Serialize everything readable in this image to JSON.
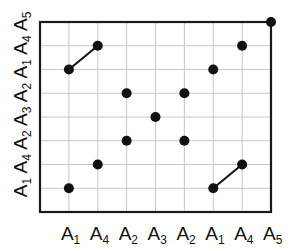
{
  "diagram": {
    "type": "dot-matrix",
    "x_labels": [
      {
        "base": "A",
        "sub": "1"
      },
      {
        "base": "A",
        "sub": "4"
      },
      {
        "base": "A",
        "sub": "2"
      },
      {
        "base": "A",
        "sub": "3"
      },
      {
        "base": "A",
        "sub": "2"
      },
      {
        "base": "A",
        "sub": "1"
      },
      {
        "base": "A",
        "sub": "4"
      },
      {
        "base": "A",
        "sub": "5"
      }
    ],
    "y_labels_bottom_to_top": [
      {
        "base": "A",
        "sub": "1"
      },
      {
        "base": "A",
        "sub": "4"
      },
      {
        "base": "A",
        "sub": "2"
      },
      {
        "base": "A",
        "sub": "3"
      },
      {
        "base": "A",
        "sub": "2"
      },
      {
        "base": "A",
        "sub": "1"
      },
      {
        "base": "A",
        "sub": "4"
      },
      {
        "base": "A",
        "sub": "5"
      }
    ],
    "dots": [
      {
        "col": 1,
        "row": 1
      },
      {
        "col": 2,
        "row": 2
      },
      {
        "col": 3,
        "row": 3
      },
      {
        "col": 4,
        "row": 4
      },
      {
        "col": 5,
        "row": 3
      },
      {
        "col": 6,
        "row": 6
      },
      {
        "col": 7,
        "row": 7
      },
      {
        "col": 8,
        "row": 8
      },
      {
        "col": 1,
        "row": 6
      },
      {
        "col": 2,
        "row": 7
      },
      {
        "col": 5,
        "row": 5
      },
      {
        "col": 6,
        "row": 1
      },
      {
        "col": 7,
        "row": 2
      },
      {
        "col": 3,
        "row": 5
      }
    ],
    "segments": [
      {
        "from": {
          "col": 1,
          "row": 6
        },
        "to": {
          "col": 2,
          "row": 7
        }
      },
      {
        "from": {
          "col": 6,
          "row": 1
        },
        "to": {
          "col": 7,
          "row": 2
        }
      }
    ],
    "colors": {
      "frame": "#1a1a1a",
      "grid": "#c8c8c8",
      "dot": "#111111",
      "text": "#111111"
    }
  }
}
